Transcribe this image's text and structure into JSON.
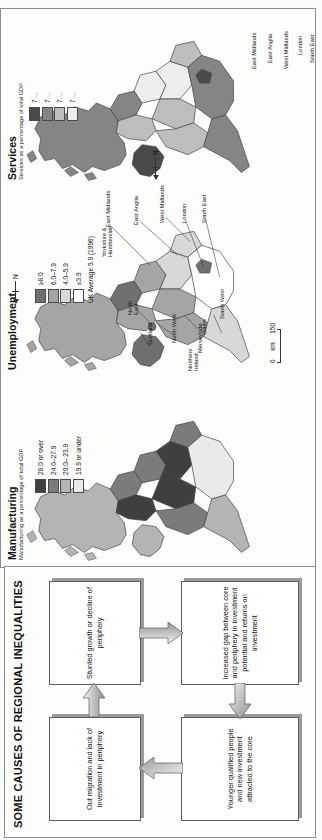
{
  "maps_figure": {
    "panels": [
      {
        "id": "manufacturing",
        "title": "Manufacturing",
        "subtitle": "Manufacturing as a percentage of total GDP",
        "legend": {
          "entries": [
            {
              "label": "28.0 or over",
              "color": "#3f3f3f"
            },
            {
              "label": "24.0–27.9",
              "color": "#7b7b7b"
            },
            {
              "label": "20.0– 23.9",
              "color": "#b4b4b4"
            },
            {
              "label": "19.9 or under",
              "color": "#eaeaea"
            }
          ]
        },
        "regions": [
          {
            "name": "Scotland",
            "class": 2
          },
          {
            "name": "Northern Ireland",
            "class": 2
          },
          {
            "name": "North East",
            "class": 1
          },
          {
            "name": "North West",
            "class": 0
          },
          {
            "name": "Yorkshire & Humberside",
            "class": 1
          },
          {
            "name": "East Midlands",
            "class": 0
          },
          {
            "name": "West Midlands",
            "class": 0
          },
          {
            "name": "East Anglia",
            "class": 1
          },
          {
            "name": "Wales",
            "class": 1
          },
          {
            "name": "South West",
            "class": 2
          },
          {
            "name": "South East",
            "class": 3
          },
          {
            "name": "London",
            "class": 3
          }
        ]
      },
      {
        "id": "unemployment",
        "title": "Unemployment",
        "subtitle": "",
        "legend": {
          "entries": [
            {
              "label": "≥8.0",
              "color": "#6f6f6f"
            },
            {
              "label": "6.0–7.9",
              "color": "#a5a5a5"
            },
            {
              "label": "4.0–5.9",
              "color": "#d8d8d8"
            },
            {
              "label": "≤3.9",
              "color": "#ffffff"
            }
          ],
          "note": "UK Average 5.9 (1996)"
        },
        "north_label": "N",
        "scale": {
          "left": "0",
          "mid": "km",
          "right": "150"
        },
        "regions": [
          {
            "name": "Scotland",
            "class": 1
          },
          {
            "name": "Northern Ireland",
            "class": 0
          },
          {
            "name": "North East",
            "class": 0
          },
          {
            "name": "North West",
            "class": 1
          },
          {
            "name": "Merseyside",
            "class": 0
          },
          {
            "name": "Yorkshire & Humberside",
            "class": 1
          },
          {
            "name": "East Midlands",
            "class": 2
          },
          {
            "name": "West Midlands",
            "class": 1
          },
          {
            "name": "East Anglia",
            "class": 2
          },
          {
            "name": "Wales",
            "class": 1
          },
          {
            "name": "South West",
            "class": 2
          },
          {
            "name": "South East",
            "class": 3
          },
          {
            "name": "London",
            "class": 0
          }
        ],
        "callouts": [
          "Scotland",
          "Northern Ireland",
          "North East",
          "North West",
          "Merseyside",
          "Yorkshire & Humberside",
          "Wales",
          "South West",
          "East Midlands",
          "East Anglia",
          "West Midlands",
          "London",
          "South East"
        ]
      },
      {
        "id": "services",
        "title": "Services",
        "subtitle": "Services as a percentage of total GDP",
        "legend": {
          "entries": [
            {
              "label": "7…",
              "color": "#4a4a4a"
            },
            {
              "label": "7…",
              "color": "#858585"
            },
            {
              "label": "7…",
              "color": "#bdbdbd"
            },
            {
              "label": "7…",
              "color": "#ededed"
            }
          ]
        },
        "north_label": "N",
        "regions": [
          {
            "name": "Scotland",
            "class": 1
          },
          {
            "name": "Northern Ireland",
            "class": 0
          },
          {
            "name": "North East",
            "class": 1
          },
          {
            "name": "North West",
            "class": 2
          },
          {
            "name": "Yorkshire & Humberside",
            "class": 3
          },
          {
            "name": "East Midlands",
            "class": 3
          },
          {
            "name": "West Midlands",
            "class": 2
          },
          {
            "name": "East Anglia",
            "class": 2
          },
          {
            "name": "Wales",
            "class": 2
          },
          {
            "name": "South West",
            "class": 1
          },
          {
            "name": "South East",
            "class": 1
          },
          {
            "name": "London",
            "class": 0
          }
        ],
        "callouts": [
          "East Midlands",
          "East Anglia",
          "West Midlands",
          "London",
          "South East"
        ]
      }
    ]
  },
  "diagram": {
    "title": "SOME CAUSES OF REGIONAL INEQUALITIES",
    "boxes": [
      {
        "id": "out-migration",
        "text": "Out migration and lack of investment in periphery"
      },
      {
        "id": "stunted-growth",
        "text": "Stunted growth or decline of periphery"
      },
      {
        "id": "increased-gap",
        "text": "Increased gap between core and periphery in investment potential and returns on investment"
      },
      {
        "id": "younger-qualified",
        "text": "Younger qualified people and new investment attracted to the core"
      }
    ],
    "arrows": [
      {
        "id": "arrow-top-right",
        "from": "out-migration",
        "to": "stunted-growth",
        "direction": "right"
      },
      {
        "id": "arrow-right-down",
        "from": "stunted-growth",
        "to": "increased-gap",
        "direction": "down"
      },
      {
        "id": "arrow-bottom-left",
        "from": "increased-gap",
        "to": "younger-qualified",
        "direction": "left"
      },
      {
        "id": "arrow-left-up",
        "from": "younger-qualified",
        "to": "out-migration",
        "direction": "up"
      }
    ]
  }
}
